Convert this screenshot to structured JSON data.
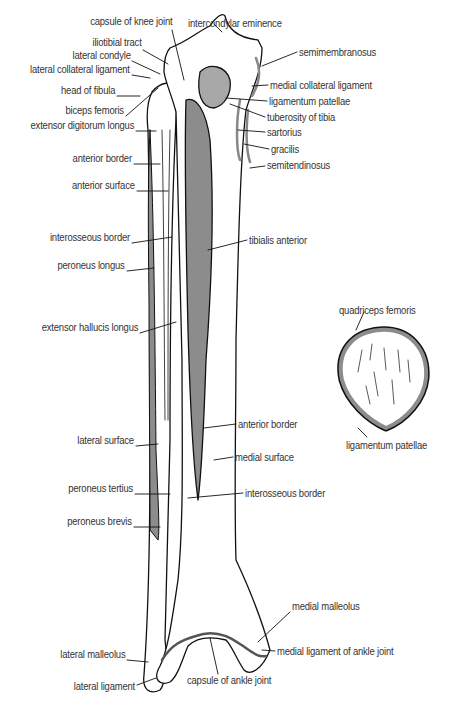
{
  "figure": {
    "type": "anatomical illustration",
    "colors": {
      "outline": "#111111",
      "muscle": "#8c8c8c",
      "bone": "#ffffff",
      "text": "#333333"
    }
  },
  "labels_left": [
    {
      "id": "capsule-of-knee-joint",
      "text": "capsule of knee joint",
      "x": 173,
      "y": 21
    },
    {
      "id": "iliotibial-tract",
      "text": "iliotibial tract",
      "x": 142,
      "y": 42
    },
    {
      "id": "lateral-condyle",
      "text": "lateral condyle",
      "x": 131,
      "y": 55
    },
    {
      "id": "lateral-collateral-ligament",
      "text": "lateral collateral ligament",
      "x": 130,
      "y": 69
    },
    {
      "id": "head-of-fibula",
      "text": "head of fibula",
      "x": 115,
      "y": 90
    },
    {
      "id": "biceps-femoris",
      "text": "biceps femoris",
      "x": 124,
      "y": 110
    },
    {
      "id": "extensor-digitorum-longus",
      "text": "extensor digitorum longus",
      "x": 134,
      "y": 125
    },
    {
      "id": "anterior-border-fibula",
      "text": "anterior border",
      "x": 132,
      "y": 158
    },
    {
      "id": "anterior-surface",
      "text": "anterior surface",
      "x": 135,
      "y": 185
    },
    {
      "id": "interosseous-border-fibula",
      "text": "interosseous border",
      "x": 130,
      "y": 237
    },
    {
      "id": "peroneus-longus",
      "text": "peroneus longus",
      "x": 125,
      "y": 265
    },
    {
      "id": "extensor-hallucis-longus",
      "text": "extensor hallucis longus",
      "x": 138,
      "y": 327
    },
    {
      "id": "lateral-surface",
      "text": "lateral surface",
      "x": 134,
      "y": 440
    },
    {
      "id": "peroneus-tertius",
      "text": "peroneus tertius",
      "x": 133,
      "y": 488
    },
    {
      "id": "peroneus-brevis",
      "text": "peroneus brevis",
      "x": 132,
      "y": 521
    },
    {
      "id": "lateral-malleolus",
      "text": "lateral malleolus",
      "x": 125,
      "y": 654
    },
    {
      "id": "lateral-ligament",
      "text": "lateral ligament",
      "x": 135,
      "y": 686
    }
  ],
  "labels_right": [
    {
      "id": "intercondylar-eminence",
      "text": "intercondylar eminence",
      "x": 188,
      "y": 17
    },
    {
      "id": "semimembranosus",
      "text": "semimembranosus",
      "x": 299,
      "y": 46
    },
    {
      "id": "medial-collateral-ligament",
      "text": "medial collateral ligament",
      "x": 270,
      "y": 79
    },
    {
      "id": "ligamentum-patellae-tibia",
      "text": "ligamentum patellae",
      "x": 269,
      "y": 95
    },
    {
      "id": "tuberosity-of-tibia",
      "text": "tuberosity of tibia",
      "x": 267,
      "y": 111
    },
    {
      "id": "sartorius",
      "text": "sartorius",
      "x": 267,
      "y": 126
    },
    {
      "id": "gracilis",
      "text": "gracilis",
      "x": 271,
      "y": 143
    },
    {
      "id": "semitendinosus",
      "text": "semitendinosus",
      "x": 267,
      "y": 159
    },
    {
      "id": "tibialis-anterior",
      "text": "tibialis anterior",
      "x": 249,
      "y": 234
    },
    {
      "id": "quadriceps-femoris",
      "text": "quadriceps femoris",
      "x": 339,
      "y": 304
    },
    {
      "id": "anterior-border-tibia",
      "text": "anterior border",
      "x": 238,
      "y": 418
    },
    {
      "id": "ligamentum-patellae-patella",
      "text": "ligamentum patellae",
      "x": 346,
      "y": 439
    },
    {
      "id": "medial-surface",
      "text": "medial surface",
      "x": 235,
      "y": 451
    },
    {
      "id": "interosseous-border-tibia",
      "text": "interosseous border",
      "x": 245,
      "y": 487
    },
    {
      "id": "medial-malleolus",
      "text": "medial malleolus",
      "x": 292,
      "y": 600
    },
    {
      "id": "medial-ligament-of-ankle-joint",
      "text": "medial ligament of ankle joint",
      "x": 277,
      "y": 645
    },
    {
      "id": "capsule-of-ankle-joint",
      "text": "capsule of ankle joint",
      "x": 187,
      "y": 674
    }
  ]
}
